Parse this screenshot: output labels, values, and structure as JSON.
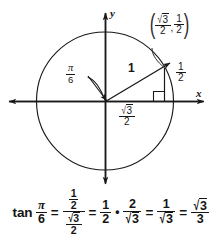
{
  "figure": {
    "background_color": "#ffffff",
    "stroke_color": "#1a1a1a",
    "axes": {
      "x_label": "x",
      "y_label": "y",
      "origin": {
        "x": 105,
        "y": 101
      }
    },
    "circle": {
      "center_x": 105,
      "center_y": 101,
      "radius": 68
    },
    "angle": {
      "label_numerator": "π",
      "label_denominator": "6",
      "degrees": 30
    },
    "radius_label": "1",
    "point": {
      "x_numerator": "3",
      "x_denominator": "2",
      "x_radical": "√",
      "y_numerator": "1",
      "y_denominator": "2",
      "comma": ","
    },
    "leg_vertical": {
      "numerator": "1",
      "denominator": "2"
    },
    "leg_horizontal": {
      "radical": "√",
      "radicand": "3",
      "denominator": "2"
    },
    "right_angle_marker": "right-angle"
  },
  "equation": {
    "function_name": "tan",
    "angle_numerator": "π",
    "angle_denominator": "6",
    "equals": "=",
    "multiply_dot": "•",
    "step1": {
      "num_numerator": "1",
      "num_denominator": "2",
      "den_radical": "√",
      "den_radicand": "3",
      "den_denominator": "2"
    },
    "step2": {
      "numerator": "1",
      "denominator": "2"
    },
    "step3": {
      "numerator": "2",
      "denominator_radical": "√",
      "denominator_radicand": "3"
    },
    "step4": {
      "numerator": "1",
      "denominator_radical": "√",
      "denominator_radicand": "3"
    },
    "step5": {
      "numerator_radical": "√",
      "numerator_radicand": "3",
      "denominator": "3"
    }
  }
}
